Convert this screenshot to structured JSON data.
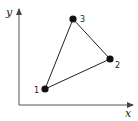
{
  "diagram": {
    "axes": {
      "x_label": "x",
      "y_label": "y",
      "color": "#555555"
    },
    "points": [
      {
        "label": "1",
        "cx": 45,
        "cy": 89
      },
      {
        "label": "2",
        "cx": 110,
        "cy": 59
      },
      {
        "label": "3",
        "cx": 73,
        "cy": 19
      }
    ],
    "edges": [
      [
        "1",
        "2"
      ],
      [
        "2",
        "3"
      ],
      [
        "3",
        "1"
      ]
    ],
    "colors": {
      "point": "#111111",
      "edge": "#222222"
    }
  }
}
